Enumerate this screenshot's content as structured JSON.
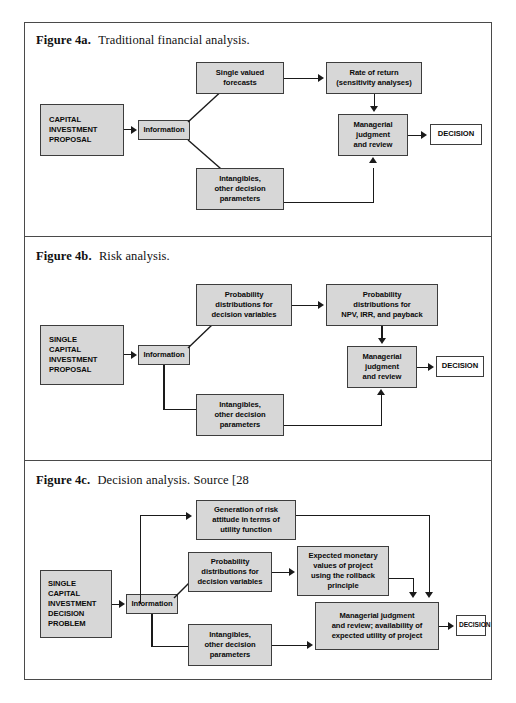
{
  "page": {
    "background": "#ffffff",
    "frame_color": "#4a4a4a",
    "node_fill": "#d7d7d7",
    "node_border": "#3d3d3d",
    "line_color": "#1a1a1a"
  },
  "figures": [
    {
      "id": "fig-4a",
      "caption_label": "Figure 4a.",
      "caption_text": "Traditional financial analysis.",
      "nodes": {
        "source": "CAPITAL\nINVESTMENT\nPROPOSAL",
        "source_l1": "CAPITAL",
        "source_l2": "INVESTMENT",
        "source_l3": "PROPOSAL",
        "information": "Information",
        "forecasts_l1": "Single valued",
        "forecasts_l2": "forecasts",
        "rate_l1": "Rate of return",
        "rate_l2": "(sensitivity analyses)",
        "intangibles_l1": "Intangibles,",
        "intangibles_l2": "other decision",
        "intangibles_l3": "parameters",
        "managerial_l1": "Managerial",
        "managerial_l2": "judgment",
        "managerial_l3": "and review",
        "decision": "DECISION"
      }
    },
    {
      "id": "fig-4b",
      "caption_label": "Figure 4b.",
      "caption_text": "Risk analysis.",
      "nodes": {
        "source_l1": "SINGLE",
        "source_l2": "CAPITAL",
        "source_l3": "INVESTMENT",
        "source_l4": "PROPOSAL",
        "information": "Information",
        "probdist_l1": "Probability",
        "probdist_l2": "distributions for",
        "probdist_l3": "decision variables",
        "npv_l1": "Probability",
        "npv_l2": "distributions for",
        "npv_l3": "NPV, IRR, and payback",
        "intangibles_l1": "Intangibles,",
        "intangibles_l2": "other decision",
        "intangibles_l3": "parameters",
        "managerial_l1": "Managerial",
        "managerial_l2": "judgment",
        "managerial_l3": "and review",
        "decision": "DECISION"
      }
    },
    {
      "id": "fig-4c",
      "caption_label": "Figure 4c.",
      "caption_text": "Decision analysis. Source [28",
      "nodes": {
        "source_l1": "SINGLE",
        "source_l2": "CAPITAL",
        "source_l3": "INVESTMENT",
        "source_l4": "DECISION",
        "source_l5": "PROBLEM",
        "information": "Information",
        "utility_l1": "Generation of risk",
        "utility_l2": "attitude in terms of",
        "utility_l3": "utility function",
        "probdist_l1": "Probability",
        "probdist_l2": "distributions for",
        "probdist_l3": "decision variables",
        "emv_l1": "Expected monetary",
        "emv_l2": "values of project",
        "emv_l3": "using the rollback",
        "emv_l4": "principle",
        "intangibles_l1": "Intangibles,",
        "intangibles_l2": "other decision",
        "intangibles_l3": "parameters",
        "managerial_l1": "Managerial judgment",
        "managerial_l2": "and review; availability of",
        "managerial_l3": "expected utility of project",
        "decision": "DECISION"
      }
    }
  ]
}
